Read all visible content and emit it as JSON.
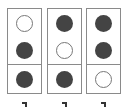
{
  "grid": {
    "columns": [
      {
        "cells": [
          "empty",
          "filled",
          "filled"
        ],
        "label": "¬"
      },
      {
        "cells": [
          "filled",
          "empty",
          "filled"
        ],
        "label": "¬"
      },
      {
        "cells": [
          "filled",
          "filled",
          "empty"
        ],
        "label": "¬"
      }
    ]
  },
  "colors": {
    "filled": "#444444",
    "empty_border": "#777777",
    "grid_border": "#8a8a8a"
  }
}
